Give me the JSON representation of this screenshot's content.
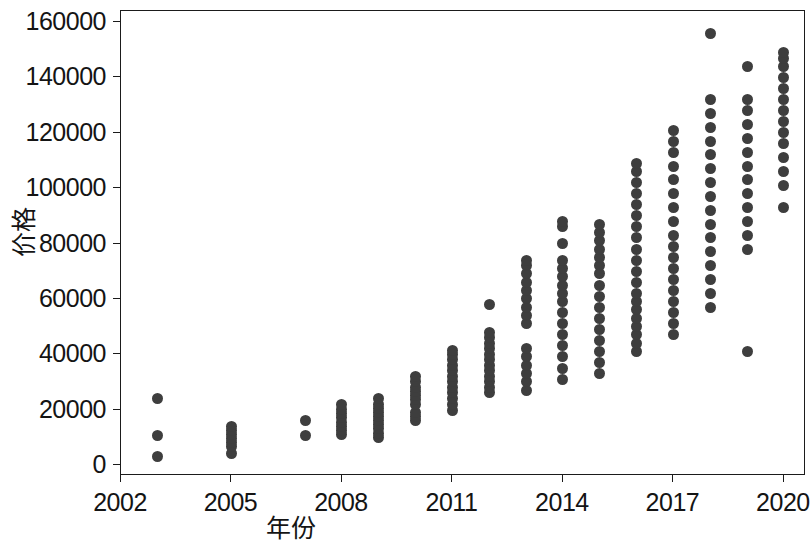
{
  "chart_data": {
    "type": "scatter",
    "title": "",
    "xlabel": "年份",
    "ylabel": "价格",
    "xlim": [
      2002,
      2020.6
    ],
    "ylim": [
      -4000,
      164000
    ],
    "grid": false,
    "legend": null,
    "point_color": "#3e3e3e",
    "point_size_px": 11,
    "background": "#ffffff",
    "xticks": [
      2002,
      2005,
      2008,
      2011,
      2014,
      2017,
      2020
    ],
    "xtick_labels": [
      "2002",
      "2005",
      "2008",
      "2011",
      "2014",
      "2017",
      "2020"
    ],
    "yticks": [
      0,
      20000,
      40000,
      60000,
      80000,
      100000,
      120000,
      140000,
      160000
    ],
    "ytick_labels": [
      "0",
      "20000",
      "40000",
      "60000",
      "80000",
      "100000",
      "120000",
      "140000",
      "160000"
    ],
    "series": [
      {
        "name": "价格",
        "points": [
          [
            2003,
            3000
          ],
          [
            2003,
            10500
          ],
          [
            2003,
            24000
          ],
          [
            2005,
            4000
          ],
          [
            2005,
            6500
          ],
          [
            2005,
            8000
          ],
          [
            2005,
            9500
          ],
          [
            2005,
            11000
          ],
          [
            2005,
            12500
          ],
          [
            2005,
            14000
          ],
          [
            2007,
            10500
          ],
          [
            2007,
            16000
          ],
          [
            2008,
            11000
          ],
          [
            2008,
            12500
          ],
          [
            2008,
            14000
          ],
          [
            2008,
            15500
          ],
          [
            2008,
            17000
          ],
          [
            2008,
            18500
          ],
          [
            2008,
            20000
          ],
          [
            2008,
            22000
          ],
          [
            2009,
            10000
          ],
          [
            2009,
            11500
          ],
          [
            2009,
            13000
          ],
          [
            2009,
            14500
          ],
          [
            2009,
            16000
          ],
          [
            2009,
            17500
          ],
          [
            2009,
            19000
          ],
          [
            2009,
            20500
          ],
          [
            2009,
            22000
          ],
          [
            2009,
            24000
          ],
          [
            2010,
            16000
          ],
          [
            2010,
            17500
          ],
          [
            2010,
            19000
          ],
          [
            2010,
            22000
          ],
          [
            2010,
            23500
          ],
          [
            2010,
            25000
          ],
          [
            2010,
            26500
          ],
          [
            2010,
            28000
          ],
          [
            2010,
            30000
          ],
          [
            2010,
            32000
          ],
          [
            2011,
            19500
          ],
          [
            2011,
            22000
          ],
          [
            2011,
            24000
          ],
          [
            2011,
            26000
          ],
          [
            2011,
            28000
          ],
          [
            2011,
            30000
          ],
          [
            2011,
            32000
          ],
          [
            2011,
            34000
          ],
          [
            2011,
            36000
          ],
          [
            2011,
            38000
          ],
          [
            2011,
            40000
          ],
          [
            2011,
            41500
          ],
          [
            2012,
            26000
          ],
          [
            2012,
            28000
          ],
          [
            2012,
            30000
          ],
          [
            2012,
            32000
          ],
          [
            2012,
            34000
          ],
          [
            2012,
            36000
          ],
          [
            2012,
            38000
          ],
          [
            2012,
            40000
          ],
          [
            2012,
            42000
          ],
          [
            2012,
            44000
          ],
          [
            2012,
            46000
          ],
          [
            2012,
            48000
          ],
          [
            2012,
            58000
          ],
          [
            2013,
            27000
          ],
          [
            2013,
            30000
          ],
          [
            2013,
            33000
          ],
          [
            2013,
            36000
          ],
          [
            2013,
            39000
          ],
          [
            2013,
            42000
          ],
          [
            2013,
            51000
          ],
          [
            2013,
            54000
          ],
          [
            2013,
            57000
          ],
          [
            2013,
            60000
          ],
          [
            2013,
            63000
          ],
          [
            2013,
            66000
          ],
          [
            2013,
            69000
          ],
          [
            2013,
            72000
          ],
          [
            2013,
            74000
          ],
          [
            2014,
            31000
          ],
          [
            2014,
            35000
          ],
          [
            2014,
            39000
          ],
          [
            2014,
            43000
          ],
          [
            2014,
            47000
          ],
          [
            2014,
            51000
          ],
          [
            2014,
            55000
          ],
          [
            2014,
            59000
          ],
          [
            2014,
            62000
          ],
          [
            2014,
            65000
          ],
          [
            2014,
            68000
          ],
          [
            2014,
            71000
          ],
          [
            2014,
            74000
          ],
          [
            2014,
            80000
          ],
          [
            2014,
            86000
          ],
          [
            2014,
            88000
          ],
          [
            2015,
            33000
          ],
          [
            2015,
            37000
          ],
          [
            2015,
            41000
          ],
          [
            2015,
            45000
          ],
          [
            2015,
            49000
          ],
          [
            2015,
            53000
          ],
          [
            2015,
            57000
          ],
          [
            2015,
            61000
          ],
          [
            2015,
            65000
          ],
          [
            2015,
            69000
          ],
          [
            2015,
            72000
          ],
          [
            2015,
            75000
          ],
          [
            2015,
            78000
          ],
          [
            2015,
            81000
          ],
          [
            2015,
            84000
          ],
          [
            2015,
            87000
          ],
          [
            2016,
            41000
          ],
          [
            2016,
            44000
          ],
          [
            2016,
            47000
          ],
          [
            2016,
            50000
          ],
          [
            2016,
            53000
          ],
          [
            2016,
            56000
          ],
          [
            2016,
            59000
          ],
          [
            2016,
            62000
          ],
          [
            2016,
            66000
          ],
          [
            2016,
            70000
          ],
          [
            2016,
            74000
          ],
          [
            2016,
            78000
          ],
          [
            2016,
            82000
          ],
          [
            2016,
            86000
          ],
          [
            2016,
            90000
          ],
          [
            2016,
            94000
          ],
          [
            2016,
            98000
          ],
          [
            2016,
            102000
          ],
          [
            2016,
            106000
          ],
          [
            2016,
            109000
          ],
          [
            2017,
            47000
          ],
          [
            2017,
            51000
          ],
          [
            2017,
            55000
          ],
          [
            2017,
            59000
          ],
          [
            2017,
            63000
          ],
          [
            2017,
            67000
          ],
          [
            2017,
            71000
          ],
          [
            2017,
            75000
          ],
          [
            2017,
            79000
          ],
          [
            2017,
            83000
          ],
          [
            2017,
            88000
          ],
          [
            2017,
            93000
          ],
          [
            2017,
            98000
          ],
          [
            2017,
            103000
          ],
          [
            2017,
            108000
          ],
          [
            2017,
            113000
          ],
          [
            2017,
            117000
          ],
          [
            2017,
            121000
          ],
          [
            2018,
            57000
          ],
          [
            2018,
            62000
          ],
          [
            2018,
            67000
          ],
          [
            2018,
            72000
          ],
          [
            2018,
            77000
          ],
          [
            2018,
            82000
          ],
          [
            2018,
            87000
          ],
          [
            2018,
            92000
          ],
          [
            2018,
            97000
          ],
          [
            2018,
            102000
          ],
          [
            2018,
            107000
          ],
          [
            2018,
            112000
          ],
          [
            2018,
            117000
          ],
          [
            2018,
            122000
          ],
          [
            2018,
            127000
          ],
          [
            2018,
            132000
          ],
          [
            2018,
            156000
          ],
          [
            2019,
            41000
          ],
          [
            2019,
            78000
          ],
          [
            2019,
            83000
          ],
          [
            2019,
            88000
          ],
          [
            2019,
            93000
          ],
          [
            2019,
            98000
          ],
          [
            2019,
            103000
          ],
          [
            2019,
            108000
          ],
          [
            2019,
            113000
          ],
          [
            2019,
            118000
          ],
          [
            2019,
            123000
          ],
          [
            2019,
            128000
          ],
          [
            2019,
            132000
          ],
          [
            2019,
            144000
          ],
          [
            2020,
            93000
          ],
          [
            2020,
            101000
          ],
          [
            2020,
            106000
          ],
          [
            2020,
            111000
          ],
          [
            2020,
            116000
          ],
          [
            2020,
            120000
          ],
          [
            2020,
            124000
          ],
          [
            2020,
            128000
          ],
          [
            2020,
            132000
          ],
          [
            2020,
            136000
          ],
          [
            2020,
            140000
          ],
          [
            2020,
            144000
          ],
          [
            2020,
            147000
          ],
          [
            2020,
            149000
          ]
        ]
      }
    ]
  }
}
